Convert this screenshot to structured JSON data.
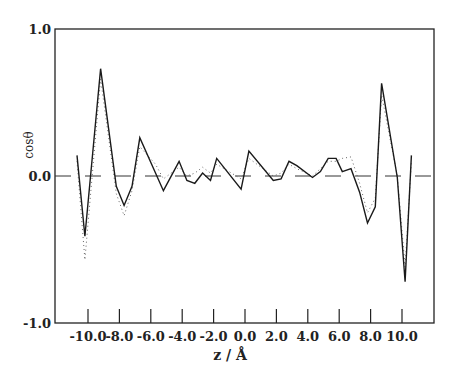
{
  "chart_data": {
    "type": "line",
    "title": "",
    "xlabel": "z / Å",
    "ylabel": "cosθ",
    "xlim": [
      -11.0,
      12.0
    ],
    "ylim": [
      -1.0,
      1.0
    ],
    "x_ticks": [
      -10.0,
      -8.0,
      -6.0,
      -4.0,
      -2.0,
      0.0,
      2.0,
      4.0,
      6.0,
      8.0,
      10.0
    ],
    "x_tick_labels": [
      "-10.0",
      "-8.0",
      "-6.0",
      "-4.0",
      "-2.0",
      "0.0",
      "2.0",
      "4.0",
      "6.0",
      "8.0",
      "10.0"
    ],
    "y_ticks": [
      -1.0,
      0.0,
      1.0
    ],
    "y_tick_labels": [
      "-1.0",
      "0.0",
      "1.0"
    ],
    "grid": false,
    "legend": null,
    "reference_line": {
      "y": 0.0,
      "style": "dashed"
    },
    "series": [
      {
        "name": "solid",
        "style": "solid",
        "x": [
          -10.7,
          -10.2,
          -9.2,
          -8.2,
          -7.7,
          -7.2,
          -6.7,
          -5.2,
          -4.2,
          -3.7,
          -3.2,
          -2.7,
          -2.2,
          -1.8,
          -0.25,
          0.25,
          1.8,
          2.3,
          2.8,
          3.3,
          4.3,
          4.8,
          5.3,
          5.8,
          6.2,
          6.75,
          7.3,
          7.8,
          8.3,
          8.7,
          9.7,
          10.2,
          10.6
        ],
        "values": [
          0.14,
          -0.41,
          0.73,
          -0.07,
          -0.2,
          -0.07,
          0.26,
          -0.1,
          0.1,
          -0.03,
          -0.05,
          0.02,
          -0.03,
          0.12,
          -0.09,
          0.17,
          -0.03,
          -0.02,
          0.1,
          0.07,
          -0.01,
          0.03,
          0.12,
          0.12,
          0.03,
          0.05,
          -0.11,
          -0.32,
          -0.21,
          0.63,
          -0.01,
          -0.72,
          0.14
        ]
      },
      {
        "name": "dotted",
        "style": "dotted",
        "x": [
          -10.7,
          -10.2,
          -9.2,
          -8.2,
          -7.7,
          -7.2,
          -6.7,
          -5.7,
          -5.2,
          -4.2,
          -3.7,
          -3.2,
          -2.7,
          -2.2,
          -1.8,
          -0.25,
          0.25,
          1.8,
          2.3,
          2.8,
          3.3,
          4.3,
          4.8,
          5.3,
          5.8,
          6.2,
          6.75,
          7.3,
          7.8,
          8.3,
          8.7,
          9.7,
          10.2,
          10.6
        ],
        "values": [
          0.1,
          -0.57,
          0.66,
          -0.12,
          -0.27,
          -0.1,
          0.2,
          0.08,
          -0.02,
          0.06,
          0.0,
          0.02,
          0.06,
          0.02,
          0.08,
          -0.02,
          0.12,
          0.0,
          0.02,
          0.08,
          0.05,
          0.0,
          0.05,
          0.1,
          0.1,
          0.12,
          0.13,
          -0.05,
          -0.25,
          -0.15,
          0.55,
          0.0,
          -0.62,
          0.1
        ]
      }
    ]
  },
  "labels": {
    "xlabel": "z / Å",
    "ylabel": "cosθ"
  }
}
